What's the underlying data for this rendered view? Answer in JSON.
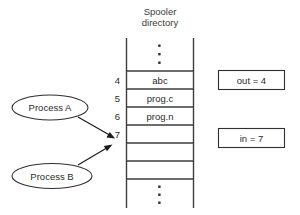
{
  "diagram": {
    "title_line1": "Spooler",
    "title_line2": "directory",
    "table": {
      "rows": [
        {
          "index": "4",
          "value": "abc"
        },
        {
          "index": "5",
          "value": "prog.c"
        },
        {
          "index": "6",
          "value": "prog.n"
        },
        {
          "index": "7",
          "value": ""
        },
        {
          "index": "",
          "value": ""
        }
      ],
      "top_ellipsis": "⋮",
      "bottom_ellipsis": "⋮"
    },
    "processes": [
      {
        "label": "Process A"
      },
      {
        "label": "Process B"
      }
    ],
    "variables": [
      {
        "label": "out = 4"
      },
      {
        "label": "in = 7"
      }
    ],
    "colors": {
      "line": "#3d3d3d",
      "text": "#2b2b2b",
      "background": "#ffffff",
      "arrow": "#1c1c1c"
    }
  }
}
